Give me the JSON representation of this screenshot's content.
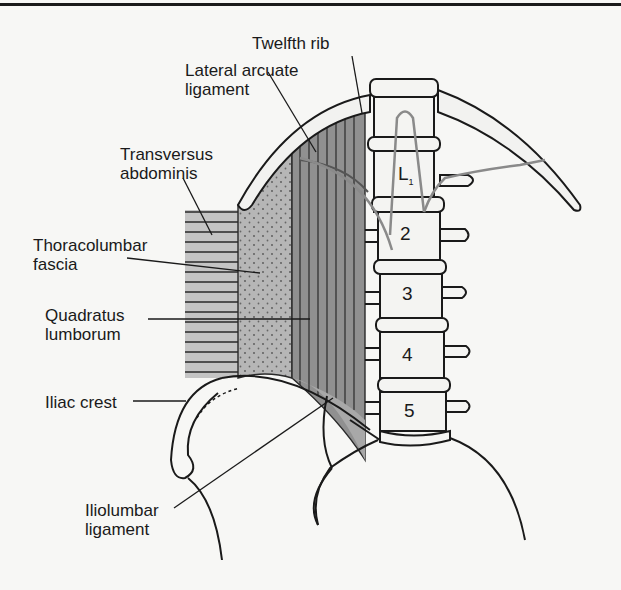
{
  "figure": {
    "labels": {
      "twelfth_rib": "Twelfth rib",
      "lateral_arcuate_ligament": "Lateral arcuate\nligament",
      "transversus_abdominis": "Transversus\nabdominis",
      "thoracolumbar_fascia": "Thoracolumbar\nfascia",
      "quadratus_lumborum": "Quadratus\nlumborum",
      "iliac_crest": "Iliac crest",
      "iliolumbar_ligament": "Iliolumbar\nligament"
    },
    "vertebrae": {
      "l1_letter": "L",
      "l1_sub": "1",
      "l2": "2",
      "l3": "3",
      "l4": "4",
      "l5": "5"
    },
    "colors": {
      "line": "#1a1a1a",
      "muscle_dark": "#8e8e8e",
      "fascia": "#b4b4b4",
      "transversus": "#c2c2c2",
      "nerve": "#8a8a8a",
      "background": "#f7f7f5"
    }
  }
}
